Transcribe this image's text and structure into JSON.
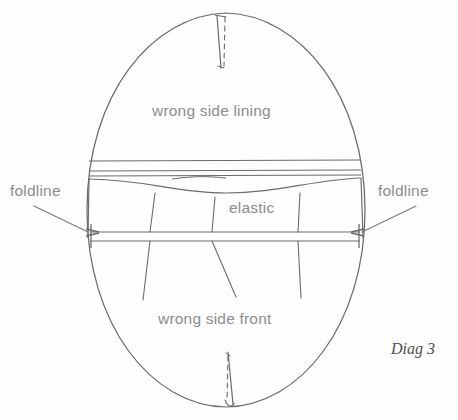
{
  "diagram": {
    "caption": "Diag 3",
    "labels": {
      "lining": "wrong side lining",
      "front": "wrong side front",
      "elastic": "elastic",
      "foldline_left": "foldline",
      "foldline_right": "foldline"
    },
    "colors": {
      "background": "#fefefe",
      "outline": "#6b6b6b",
      "label_text": "#8c8c8c",
      "caption_text": "#4d4d4d",
      "leader_line": "#7a7a7a"
    },
    "geometry": {
      "oval": {
        "cx": 226,
        "cy": 210,
        "rx": 139,
        "ry": 197,
        "top_y": 13,
        "bottom_y": 407,
        "left_x": 87,
        "right_x": 365
      },
      "band": {
        "top_y": 160,
        "seam_y": 172,
        "fold_y": 179,
        "bottom_y": 232,
        "arrow_y": 232,
        "second_y": 241
      },
      "darts": {
        "top_dart_y_range": [
          13,
          68
        ],
        "bottom_dart_y_range": [
          352,
          407
        ]
      },
      "gather_lines": 3
    }
  }
}
